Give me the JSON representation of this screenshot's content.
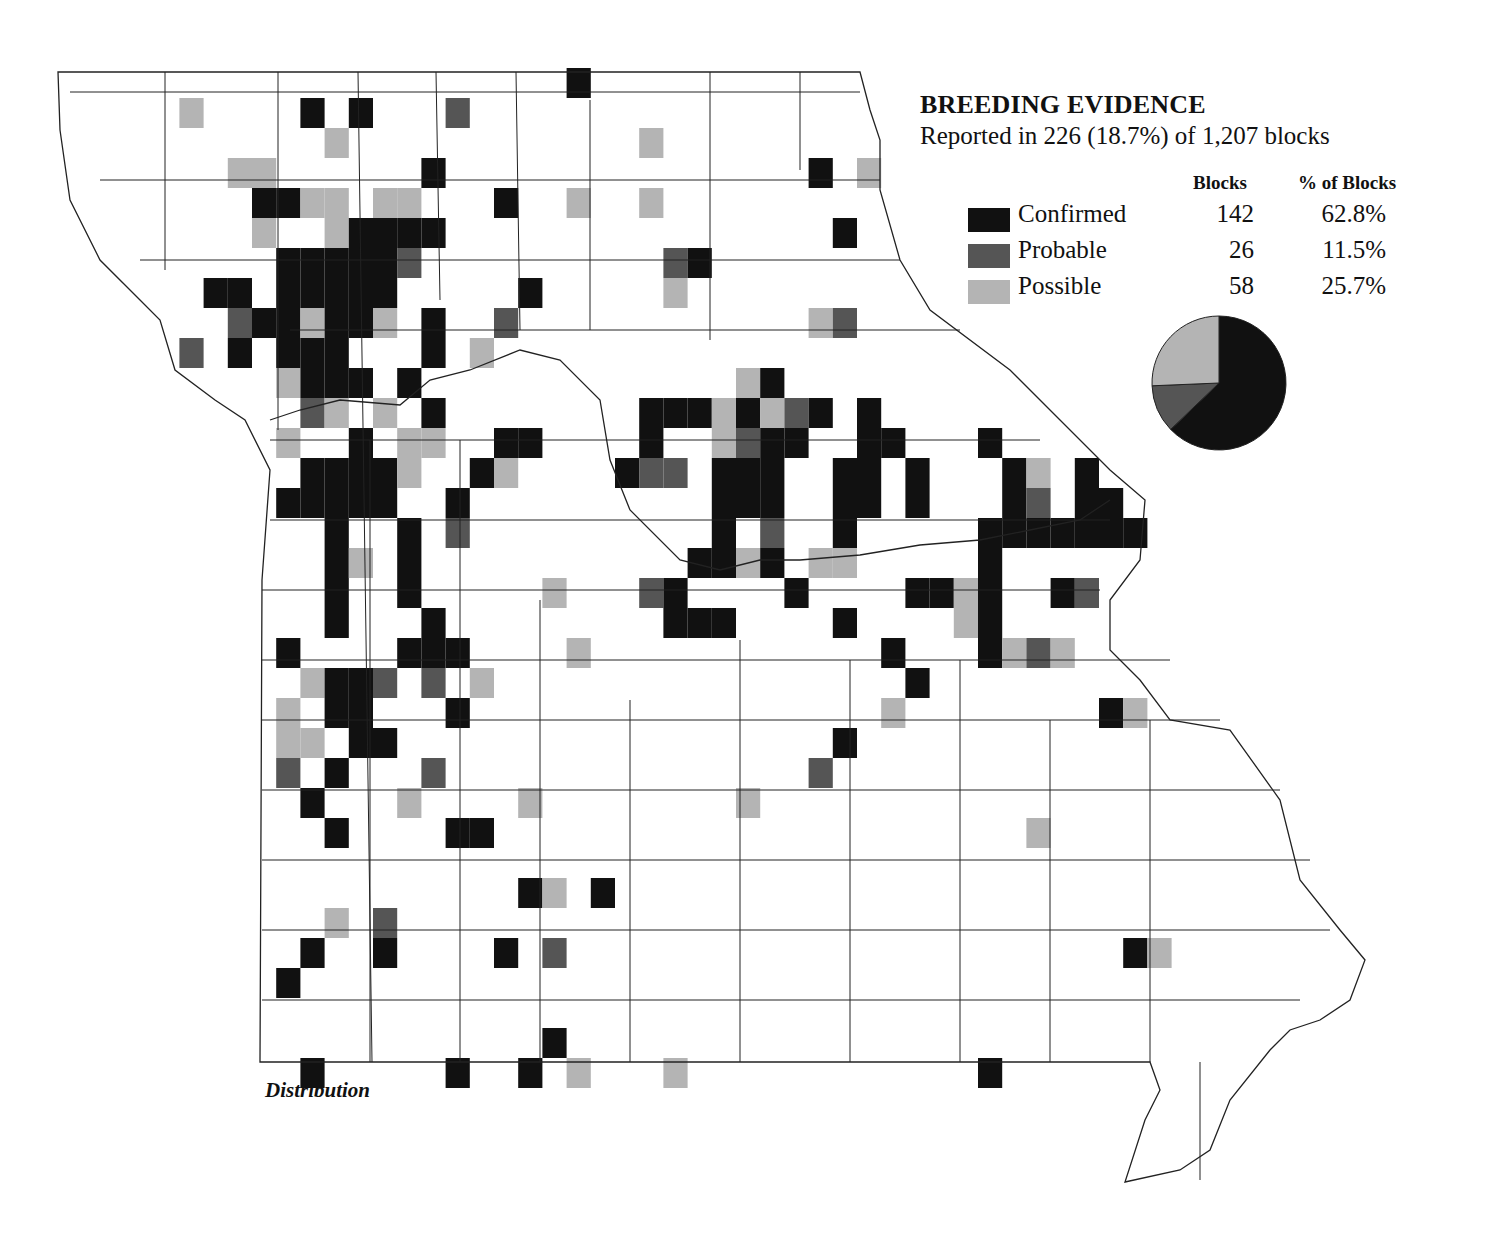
{
  "legend": {
    "title": "BREEDING EVIDENCE",
    "subtitle": "Reported in 226 (18.7%) of 1,207 blocks",
    "col_blocks": "Blocks",
    "col_pct": "% of Blocks",
    "rows": [
      {
        "label": "Confirmed",
        "blocks": "142",
        "pct": "62.8%",
        "color": "#111111"
      },
      {
        "label": "Probable",
        "blocks": "26",
        "pct": "11.5%",
        "color": "#555555"
      },
      {
        "label": "Possible",
        "blocks": "58",
        "pct": "25.7%",
        "color": "#b4b4b4"
      }
    ]
  },
  "caption": "Distribution",
  "chart_data": {
    "type": "pie",
    "title": "BREEDING EVIDENCE",
    "categories": [
      "Confirmed",
      "Probable",
      "Possible"
    ],
    "values": [
      142,
      26,
      58
    ],
    "percent": [
      62.8,
      11.5,
      25.7
    ],
    "total_reported": 226,
    "total_blocks": 1207,
    "reported_percent": 18.7
  },
  "blocks_legend_codes": {
    "C": "Confirmed",
    "P": "Probable",
    "S": "Possible"
  },
  "blocks": [
    [
      "S",
      7,
      3
    ],
    [
      "C",
      12,
      3
    ],
    [
      "C",
      14,
      3
    ],
    [
      "P",
      18,
      3
    ],
    [
      "C",
      23,
      2
    ],
    [
      "S",
      13,
      4
    ],
    [
      "S",
      26,
      4
    ],
    [
      "C",
      33,
      5
    ],
    [
      "S",
      35,
      5
    ],
    [
      "S",
      9,
      5
    ],
    [
      "S",
      10,
      5
    ],
    [
      "C",
      17,
      5
    ],
    [
      "C",
      10,
      6
    ],
    [
      "C",
      11,
      6
    ],
    [
      "S",
      12,
      6
    ],
    [
      "S",
      13,
      6
    ],
    [
      "S",
      15,
      6
    ],
    [
      "S",
      16,
      6
    ],
    [
      "C",
      20,
      6
    ],
    [
      "S",
      23,
      6
    ],
    [
      "S",
      26,
      6
    ],
    [
      "S",
      10,
      7
    ],
    [
      "S",
      13,
      7
    ],
    [
      "C",
      14,
      7
    ],
    [
      "C",
      15,
      7
    ],
    [
      "C",
      16,
      7
    ],
    [
      "C",
      17,
      7
    ],
    [
      "C",
      34,
      7
    ],
    [
      "C",
      11,
      8
    ],
    [
      "C",
      12,
      8
    ],
    [
      "C",
      13,
      8
    ],
    [
      "C",
      14,
      8
    ],
    [
      "C",
      15,
      8
    ],
    [
      "P",
      16,
      8
    ],
    [
      "P",
      27,
      8
    ],
    [
      "C",
      28,
      8
    ],
    [
      "C",
      8,
      9
    ],
    [
      "C",
      9,
      9
    ],
    [
      "C",
      11,
      9
    ],
    [
      "C",
      12,
      9
    ],
    [
      "C",
      13,
      9
    ],
    [
      "C",
      14,
      9
    ],
    [
      "C",
      15,
      9
    ],
    [
      "C",
      21,
      9
    ],
    [
      "S",
      27,
      9
    ],
    [
      "P",
      9,
      10
    ],
    [
      "C",
      10,
      10
    ],
    [
      "C",
      11,
      10
    ],
    [
      "S",
      12,
      10
    ],
    [
      "C",
      13,
      10
    ],
    [
      "C",
      14,
      10
    ],
    [
      "S",
      15,
      10
    ],
    [
      "C",
      17,
      10
    ],
    [
      "P",
      20,
      10
    ],
    [
      "S",
      33,
      10
    ],
    [
      "P",
      34,
      10
    ],
    [
      "P",
      7,
      11
    ],
    [
      "C",
      9,
      11
    ],
    [
      "C",
      11,
      11
    ],
    [
      "C",
      12,
      11
    ],
    [
      "C",
      13,
      11
    ],
    [
      "C",
      17,
      11
    ],
    [
      "S",
      19,
      11
    ],
    [
      "S",
      11,
      12
    ],
    [
      "C",
      12,
      12
    ],
    [
      "C",
      13,
      12
    ],
    [
      "C",
      14,
      12
    ],
    [
      "C",
      16,
      12
    ],
    [
      "S",
      30,
      12
    ],
    [
      "C",
      31,
      12
    ],
    [
      "P",
      12,
      13
    ],
    [
      "S",
      13,
      13
    ],
    [
      "S",
      15,
      13
    ],
    [
      "C",
      17,
      13
    ],
    [
      "C",
      26,
      13
    ],
    [
      "C",
      27,
      13
    ],
    [
      "C",
      28,
      13
    ],
    [
      "S",
      29,
      13
    ],
    [
      "C",
      30,
      13
    ],
    [
      "S",
      31,
      13
    ],
    [
      "P",
      32,
      13
    ],
    [
      "C",
      33,
      13
    ],
    [
      "C",
      35,
      13
    ],
    [
      "S",
      11,
      14
    ],
    [
      "C",
      14,
      14
    ],
    [
      "S",
      16,
      14
    ],
    [
      "S",
      17,
      14
    ],
    [
      "C",
      20,
      14
    ],
    [
      "C",
      21,
      14
    ],
    [
      "C",
      26,
      14
    ],
    [
      "S",
      29,
      14
    ],
    [
      "P",
      30,
      14
    ],
    [
      "C",
      31,
      14
    ],
    [
      "C",
      32,
      14
    ],
    [
      "C",
      35,
      14
    ],
    [
      "C",
      36,
      14
    ],
    [
      "C",
      40,
      14
    ],
    [
      "C",
      12,
      15
    ],
    [
      "C",
      13,
      15
    ],
    [
      "C",
      14,
      15
    ],
    [
      "C",
      15,
      15
    ],
    [
      "S",
      16,
      15
    ],
    [
      "C",
      19,
      15
    ],
    [
      "S",
      20,
      15
    ],
    [
      "C",
      25,
      15
    ],
    [
      "P",
      26,
      15
    ],
    [
      "P",
      27,
      15
    ],
    [
      "C",
      29,
      15
    ],
    [
      "C",
      30,
      15
    ],
    [
      "C",
      31,
      15
    ],
    [
      "C",
      34,
      15
    ],
    [
      "C",
      35,
      15
    ],
    [
      "C",
      37,
      15
    ],
    [
      "C",
      41,
      15
    ],
    [
      "S",
      42,
      15
    ],
    [
      "C",
      44,
      15
    ],
    [
      "C",
      11,
      16
    ],
    [
      "C",
      12,
      16
    ],
    [
      "C",
      13,
      16
    ],
    [
      "C",
      14,
      16
    ],
    [
      "C",
      15,
      16
    ],
    [
      "C",
      18,
      16
    ],
    [
      "C",
      29,
      16
    ],
    [
      "C",
      30,
      16
    ],
    [
      "C",
      31,
      16
    ],
    [
      "C",
      34,
      16
    ],
    [
      "C",
      35,
      16
    ],
    [
      "C",
      37,
      16
    ],
    [
      "C",
      41,
      16
    ],
    [
      "P",
      42,
      16
    ],
    [
      "C",
      44,
      16
    ],
    [
      "C",
      45,
      16
    ],
    [
      "C",
      13,
      17
    ],
    [
      "C",
      16,
      17
    ],
    [
      "P",
      18,
      17
    ],
    [
      "C",
      29,
      17
    ],
    [
      "P",
      31,
      17
    ],
    [
      "C",
      34,
      17
    ],
    [
      "C",
      40,
      17
    ],
    [
      "C",
      41,
      17
    ],
    [
      "C",
      42,
      17
    ],
    [
      "C",
      43,
      17
    ],
    [
      "C",
      44,
      17
    ],
    [
      "C",
      45,
      17
    ],
    [
      "C",
      46,
      17
    ],
    [
      "C",
      13,
      18
    ],
    [
      "S",
      14,
      18
    ],
    [
      "C",
      16,
      18
    ],
    [
      "C",
      28,
      18
    ],
    [
      "C",
      29,
      18
    ],
    [
      "S",
      30,
      18
    ],
    [
      "C",
      31,
      18
    ],
    [
      "S",
      33,
      18
    ],
    [
      "S",
      34,
      18
    ],
    [
      "C",
      40,
      18
    ],
    [
      "C",
      13,
      19
    ],
    [
      "C",
      16,
      19
    ],
    [
      "S",
      22,
      19
    ],
    [
      "P",
      26,
      19
    ],
    [
      "C",
      27,
      19
    ],
    [
      "C",
      32,
      19
    ],
    [
      "C",
      37,
      19
    ],
    [
      "C",
      38,
      19
    ],
    [
      "S",
      39,
      19
    ],
    [
      "C",
      40,
      19
    ],
    [
      "C",
      43,
      19
    ],
    [
      "P",
      44,
      19
    ],
    [
      "C",
      13,
      20
    ],
    [
      "C",
      17,
      20
    ],
    [
      "C",
      27,
      20
    ],
    [
      "C",
      28,
      20
    ],
    [
      "C",
      29,
      20
    ],
    [
      "C",
      34,
      20
    ],
    [
      "S",
      39,
      20
    ],
    [
      "C",
      40,
      20
    ],
    [
      "C",
      11,
      21
    ],
    [
      "C",
      16,
      21
    ],
    [
      "C",
      17,
      21
    ],
    [
      "C",
      18,
      21
    ],
    [
      "S",
      23,
      21
    ],
    [
      "C",
      36,
      21
    ],
    [
      "C",
      40,
      21
    ],
    [
      "S",
      41,
      21
    ],
    [
      "P",
      42,
      21
    ],
    [
      "S",
      43,
      21
    ],
    [
      "S",
      12,
      22
    ],
    [
      "C",
      13,
      22
    ],
    [
      "C",
      14,
      22
    ],
    [
      "P",
      15,
      22
    ],
    [
      "P",
      17,
      22
    ],
    [
      "S",
      19,
      22
    ],
    [
      "C",
      37,
      22
    ],
    [
      "S",
      11,
      23
    ],
    [
      "C",
      13,
      23
    ],
    [
      "C",
      14,
      23
    ],
    [
      "C",
      18,
      23
    ],
    [
      "S",
      36,
      23
    ],
    [
      "C",
      45,
      23
    ],
    [
      "S",
      46,
      23
    ],
    [
      "S",
      11,
      24
    ],
    [
      "S",
      12,
      24
    ],
    [
      "C",
      14,
      24
    ],
    [
      "C",
      15,
      24
    ],
    [
      "C",
      34,
      24
    ],
    [
      "P",
      11,
      25
    ],
    [
      "C",
      13,
      25
    ],
    [
      "P",
      17,
      25
    ],
    [
      "P",
      33,
      25
    ],
    [
      "C",
      12,
      26
    ],
    [
      "S",
      16,
      26
    ],
    [
      "S",
      21,
      26
    ],
    [
      "S",
      30,
      26
    ],
    [
      "C",
      13,
      27
    ],
    [
      "C",
      18,
      27
    ],
    [
      "C",
      19,
      27
    ],
    [
      "S",
      42,
      27
    ],
    [
      "C",
      21,
      29
    ],
    [
      "S",
      22,
      29
    ],
    [
      "C",
      24,
      29
    ],
    [
      "S",
      13,
      30
    ],
    [
      "P",
      15,
      30
    ],
    [
      "C",
      12,
      31
    ],
    [
      "C",
      15,
      31
    ],
    [
      "C",
      20,
      31
    ],
    [
      "P",
      22,
      31
    ],
    [
      "C",
      46,
      31
    ],
    [
      "S",
      47,
      31
    ],
    [
      "C",
      11,
      32
    ],
    [
      "C",
      22,
      34
    ],
    [
      "C",
      12,
      35
    ],
    [
      "C",
      18,
      35
    ],
    [
      "C",
      21,
      35
    ],
    [
      "S",
      23,
      35
    ],
    [
      "S",
      27,
      35
    ],
    [
      "C",
      40,
      35
    ]
  ]
}
